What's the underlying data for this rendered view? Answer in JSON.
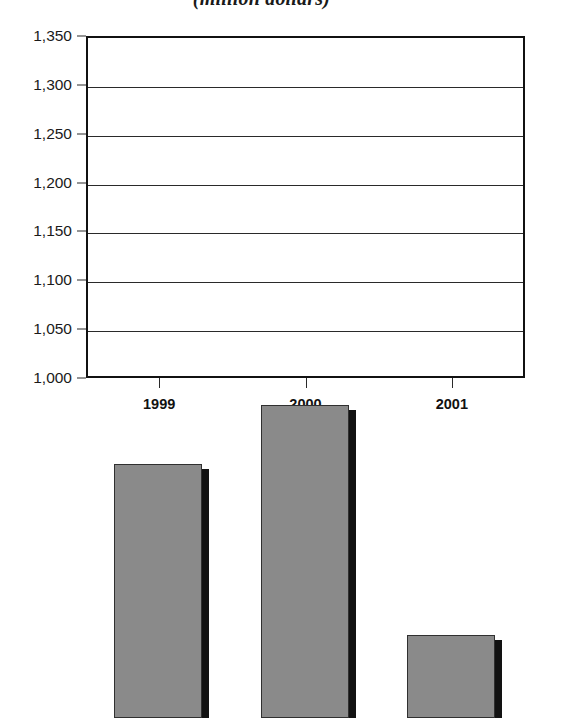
{
  "chart_data": {
    "type": "bar",
    "title": "(million dollars)",
    "xlabel": "",
    "ylabel": "",
    "categories": [
      "1999",
      "2000",
      "2001"
    ],
    "values": [
      1260,
      1320,
      1085
    ],
    "ylim": [
      1000,
      1350
    ],
    "ytick_labels": [
      "1,350",
      "1,300",
      "1,250",
      "1,200",
      "1,150",
      "1,100",
      "1,050",
      "1,000"
    ],
    "ytick_values": [
      1350,
      1300,
      1250,
      1200,
      1150,
      1100,
      1050,
      1000
    ],
    "grid": true,
    "legend": null,
    "legend_position": "none",
    "series": [
      {
        "name": "",
        "values": [
          1260,
          1320,
          1085
        ]
      }
    ],
    "colors": {
      "bar_fill": "#8a8a8a",
      "bar_shadow": "#121212",
      "bar_outline": "#303030",
      "axis": "#111111",
      "gridline": "#2a2a2a",
      "background": "#ffffff",
      "text": "#1a1a1a"
    }
  }
}
